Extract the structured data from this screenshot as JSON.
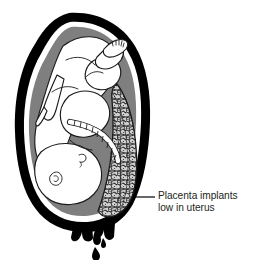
{
  "figure": {
    "background_color": "#ffffff"
  },
  "annotation": {
    "label_line_1": "Placenta implants",
    "label_line_2": "low in uterus",
    "text_color": "#231f20",
    "leader_line_color": "#231f20"
  },
  "anatomy": {
    "uterine_wall": {
      "name": "uterine wall",
      "color": "#000000"
    },
    "amniotic_fluid": {
      "name": "amniotic fluid",
      "color": "#7f7f7f"
    },
    "amniotic_membrane": {
      "name": "amniotic membrane",
      "color": "#ffffff"
    },
    "placenta": {
      "name": "placenta",
      "color": "#c8c8c8",
      "outline_color": "#1a1a1a"
    },
    "fetus": {
      "name": "fetus",
      "color": "#ffffff",
      "outline_color": "#1a1a1a",
      "presentation": "vertex"
    },
    "umbilical_cord": {
      "name": "umbilical cord",
      "color": "#ffffff",
      "outline_color": "#1a1a1a"
    },
    "cervix": {
      "name": "cervix",
      "color": "#000000"
    },
    "blood": {
      "name": "vaginal bleeding",
      "color": "#000000"
    }
  }
}
